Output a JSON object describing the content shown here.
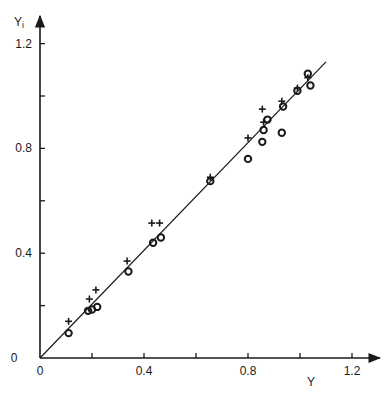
{
  "chart_data": {
    "type": "scatter",
    "title": "",
    "xlabel": "Y",
    "ylabel": "Y",
    "ylabel_subscript": "i",
    "xlim": [
      0,
      1.3
    ],
    "ylim": [
      0,
      1.3
    ],
    "x_ticks": [
      0,
      0.2,
      0.4,
      0.6,
      0.8,
      1.0,
      1.2
    ],
    "y_ticks": [
      0,
      0.2,
      0.4,
      0.6,
      0.8,
      1.0,
      1.2
    ],
    "x_tick_labels": [
      {
        "value": 0,
        "label": "0"
      },
      {
        "value": 0.4,
        "label": "0.4"
      },
      {
        "value": 0.8,
        "label": "0.8"
      },
      {
        "value": 1.2,
        "label": "1.2"
      }
    ],
    "y_tick_labels": [
      {
        "value": 0,
        "label": "0"
      },
      {
        "value": 0.4,
        "label": "0.4"
      },
      {
        "value": 0.8,
        "label": "0.8"
      },
      {
        "value": 1.2,
        "label": "1.2"
      }
    ],
    "grid": false,
    "legend": null,
    "fit_line": {
      "x": [
        0,
        1.1
      ],
      "y": [
        0,
        1.13
      ]
    },
    "series": [
      {
        "name": "plus",
        "marker": "+",
        "points": [
          [
            0.11,
            0.14
          ],
          [
            0.19,
            0.225
          ],
          [
            0.215,
            0.26
          ],
          [
            0.335,
            0.37
          ],
          [
            0.43,
            0.515
          ],
          [
            0.46,
            0.515
          ],
          [
            0.655,
            0.69
          ],
          [
            0.8,
            0.84
          ],
          [
            0.855,
            0.95
          ],
          [
            0.86,
            0.9
          ],
          [
            0.93,
            0.98
          ],
          [
            0.99,
            1.03
          ],
          [
            1.03,
            1.07
          ]
        ]
      },
      {
        "name": "circle",
        "marker": "o",
        "points": [
          [
            0.11,
            0.095
          ],
          [
            0.185,
            0.18
          ],
          [
            0.2,
            0.185
          ],
          [
            0.22,
            0.195
          ],
          [
            0.34,
            0.33
          ],
          [
            0.435,
            0.44
          ],
          [
            0.465,
            0.46
          ],
          [
            0.655,
            0.675
          ],
          [
            0.8,
            0.76
          ],
          [
            0.855,
            0.825
          ],
          [
            0.86,
            0.87
          ],
          [
            0.875,
            0.91
          ],
          [
            0.93,
            0.86
          ],
          [
            0.935,
            0.96
          ],
          [
            0.99,
            1.02
          ],
          [
            1.03,
            1.085
          ],
          [
            1.04,
            1.04
          ]
        ]
      }
    ]
  },
  "colors": {
    "ink": "#1a1a1a",
    "background": "#ffffff"
  }
}
